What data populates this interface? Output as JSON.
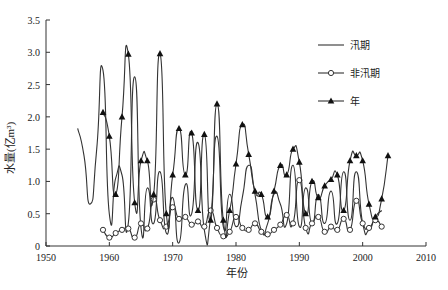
{
  "chart_data": {
    "type": "line",
    "title": "",
    "xlabel": "年份",
    "ylabel": "水量(亿m³)",
    "xlim": [
      1950,
      2010
    ],
    "ylim": [
      0,
      3.5
    ],
    "x_ticks": [
      "1950",
      "1960",
      "1970",
      "1980",
      "1990",
      "2000",
      "2010"
    ],
    "y_ticks": [
      "0",
      "0.5",
      "1.0",
      "1.5",
      "2.0",
      "2.5",
      "3.0",
      "3.5"
    ],
    "grid": false,
    "legend_position": "right",
    "series": [
      {
        "name": "汛期",
        "marker": "none",
        "x": [
          1955,
          1956,
          1957,
          1958,
          1959,
          1960,
          1961,
          1962,
          1963,
          1964,
          1965,
          1966,
          1967,
          1968,
          1969,
          1970,
          1971,
          1972,
          1973,
          1974,
          1975,
          1976,
          1977,
          1978,
          1979,
          1980,
          1981,
          1982,
          1983,
          1984,
          1985,
          1986,
          1987,
          1988,
          1989,
          1990,
          1991,
          1992,
          1993,
          1994,
          1995,
          1996,
          1997,
          1998,
          1999,
          2000,
          2001,
          2002,
          2003
        ],
        "values": [
          1.82,
          1.4,
          0.65,
          1.5,
          2.72,
          0.5,
          1.05,
          1.1,
          0.35,
          2.62,
          0.28,
          0.9,
          0.35,
          1.15,
          0.2,
          0.75,
          0.05,
          0.95,
          0.5,
          1.6,
          0.25,
          0.45,
          1.7,
          0.3,
          0.8,
          0.3,
          0.75,
          1.25,
          0.8,
          0.25,
          0.35,
          0.8,
          0.65,
          0.35,
          1.25,
          0.3,
          0.9,
          0.35,
          0.8,
          0.35,
          0.85,
          0.35,
          1.15,
          0.4,
          1.15,
          0.35,
          0.25,
          0.45,
          0.55
        ]
      },
      {
        "name": "非汛期",
        "marker": "circle",
        "x": [
          1959,
          1960,
          1961,
          1962,
          1963,
          1964,
          1965,
          1966,
          1967,
          1968,
          1969,
          1970,
          1971,
          1972,
          1973,
          1974,
          1975,
          1976,
          1977,
          1978,
          1979,
          1980,
          1981,
          1982,
          1983,
          1984,
          1985,
          1986,
          1987,
          1988,
          1989,
          1990,
          1991,
          1992,
          1993,
          1994,
          1995,
          1996,
          1997,
          1998,
          1999,
          2000,
          2001,
          2002,
          2003
        ],
        "values": [
          0.25,
          0.13,
          0.2,
          0.25,
          0.27,
          0.13,
          0.35,
          0.27,
          0.72,
          0.4,
          0.3,
          0.6,
          0.42,
          0.45,
          0.33,
          0.38,
          0.3,
          0.55,
          0.28,
          0.15,
          0.22,
          0.45,
          0.28,
          0.25,
          0.35,
          0.22,
          0.18,
          0.25,
          0.33,
          0.48,
          0.35,
          1.02,
          0.28,
          0.35,
          0.45,
          0.22,
          0.3,
          0.25,
          0.42,
          0.25,
          0.7,
          0.35,
          0.28,
          0.4,
          0.3
        ]
      },
      {
        "name": "年",
        "marker": "triangle",
        "x": [
          1959,
          1960,
          1961,
          1962,
          1963,
          1964,
          1965,
          1966,
          1967,
          1968,
          1969,
          1970,
          1971,
          1972,
          1973,
          1974,
          1975,
          1976,
          1977,
          1978,
          1979,
          1980,
          1981,
          1982,
          1983,
          1984,
          1985,
          1986,
          1987,
          1988,
          1989,
          1990,
          1991,
          1992,
          1993,
          1994,
          1995,
          1996,
          1997,
          1998,
          1999,
          2000,
          2001,
          2002,
          2003,
          2004
        ],
        "values": [
          2.07,
          1.7,
          0.8,
          2.0,
          2.97,
          0.67,
          1.32,
          1.32,
          0.8,
          2.98,
          0.5,
          1.1,
          1.82,
          1.1,
          1.75,
          0.55,
          1.73,
          0.4,
          2.2,
          0.4,
          0.55,
          1.27,
          1.88,
          1.42,
          0.85,
          0.8,
          0.45,
          0.85,
          1.25,
          1.1,
          1.5,
          1.3,
          0.5,
          1.0,
          0.75,
          0.93,
          1.03,
          1.1,
          0.55,
          1.32,
          1.4,
          1.32,
          0.65,
          0.45,
          0.73,
          1.4
        ]
      }
    ]
  },
  "legend": {
    "items": [
      {
        "label": "汛期",
        "marker": "line"
      },
      {
        "label": "非汛期",
        "marker": "circle"
      },
      {
        "label": "年",
        "marker": "triangle"
      }
    ]
  },
  "axes": {
    "xlabel": "年份",
    "ylabel": "水量(亿m³)"
  }
}
